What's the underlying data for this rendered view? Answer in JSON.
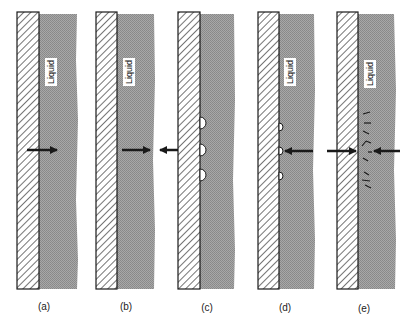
{
  "figure": {
    "type": "boiling-regime-schematic",
    "liquid_label": "Liquid",
    "colors": {
      "wall_hatch": "#2a2a2a",
      "wall_fill": "#ffffff",
      "liquid": "#9a9a9a",
      "arrow": "#1a1a1a",
      "background": "#ffffff"
    },
    "panels": [
      {
        "id": "a",
        "caption": "(a)",
        "wall_x": 17,
        "liquid_right": 78,
        "arrows": [
          "wall-to-liquid"
        ],
        "bubbles": 0,
        "vapor_marks": false
      },
      {
        "id": "b",
        "caption": "(b)",
        "wall_x": 96,
        "liquid_right": 155,
        "arrows": [
          "wall-to-liquid",
          "into-wall-from-right"
        ],
        "bubbles": 0,
        "vapor_marks": false
      },
      {
        "id": "c",
        "caption": "(c)",
        "wall_x": 178,
        "liquid_right": 235,
        "arrows": [
          "leftward-out-of-wall"
        ],
        "bubbles": 3,
        "vapor_marks": false
      },
      {
        "id": "d",
        "caption": "(d)",
        "wall_x": 258,
        "liquid_right": 315,
        "arrows": [
          "liquid-to-wall"
        ],
        "bubbles": 3,
        "vapor_marks": false
      },
      {
        "id": "e",
        "caption": "(e)",
        "wall_x": 337,
        "liquid_right": 396,
        "arrows": [
          "into-wall-from-left",
          "liquid-to-wall"
        ],
        "bubbles": 0,
        "vapor_marks": true
      }
    ]
  }
}
